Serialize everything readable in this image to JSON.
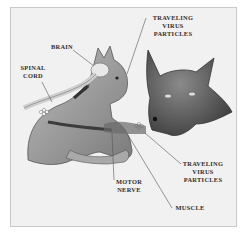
{
  "figure": {
    "colors": {
      "background": "#f1f1f1",
      "frame_border": "#c9c9c9",
      "text": "#2e2e2e",
      "line": "#555555"
    },
    "labels": {
      "traveling_top": {
        "line1": "Traveling",
        "line2": "virus",
        "line3": "particles"
      },
      "brain": "Brain",
      "spinal_cord": {
        "line1": "Spinal",
        "line2": "cord"
      },
      "traveling_bottom": {
        "line1": "Traveling",
        "line2": "virus",
        "line3": "particles"
      },
      "motor_nerve": {
        "line1": "Motor",
        "line2": "nerve"
      },
      "muscle": "Muscle"
    }
  }
}
